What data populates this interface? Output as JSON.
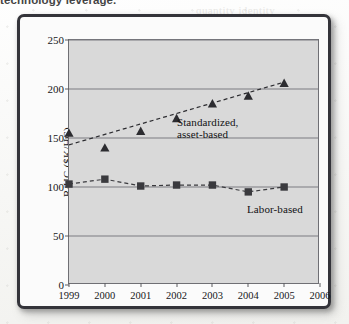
{
  "caption_fragment": "technology leverage.",
  "bleed_lines": [
    {
      "text": "quantity  identity",
      "x": 196,
      "y": 4
    },
    {
      "text": "the same",
      "x": 232,
      "y": 118
    },
    {
      "text": "of capital",
      "x": 236,
      "y": 132
    },
    {
      "text": "return",
      "x": 246,
      "y": 146
    }
  ],
  "chart_data": {
    "type": "line",
    "title": "",
    "xlabel": "",
    "ylabel": "R/HC ($K/HC)",
    "x": [
      1999,
      2000,
      2001,
      2002,
      2003,
      2004,
      2005
    ],
    "xticks": [
      1999,
      2000,
      2001,
      2002,
      2003,
      2004,
      2005,
      2006
    ],
    "xlim": [
      1999,
      2006
    ],
    "yticks": [
      0,
      50,
      100,
      150,
      200,
      250
    ],
    "ylim": [
      0,
      250
    ],
    "grid": true,
    "legend": "inline-annotations",
    "series": [
      {
        "name": "Standardized, asset-based",
        "marker": "triangle",
        "linestyle": "dashed",
        "color": "#2c2c30",
        "label_text": "Standardized,\nasset-based",
        "label_x": 108,
        "label_y": 76,
        "values": [
          155,
          140,
          157,
          170,
          185,
          193,
          206
        ],
        "trend_start": 143,
        "trend_end": 207
      },
      {
        "name": "Labor-based",
        "marker": "square",
        "linestyle": "dashed",
        "color": "#3a3a3e",
        "label_text": "Labor-based",
        "label_x": 178,
        "label_y": 163,
        "values": [
          103,
          108,
          101,
          102,
          102,
          95,
          100
        ]
      }
    ]
  }
}
